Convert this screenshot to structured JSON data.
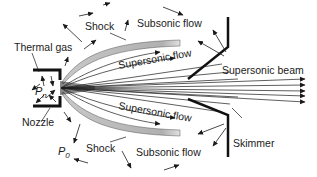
{
  "diagram": {
    "labels": {
      "thermal_gas": "Thermal gas",
      "shock_top": "Shock",
      "subsonic_top": "Subsonic flow",
      "supersonic_top": "Supersonic flow",
      "supersonic_beam": "Supersonic beam",
      "nozzle": "Nozzle",
      "pressure_nozzle": "P",
      "pressure_nozzle_sub": "n",
      "pressure_bg": "P",
      "pressure_bg_sub": "0",
      "supersonic_bottom": "Supersonic flow",
      "shock_bottom": "Shock",
      "subsonic_bottom": "Subsonic flow",
      "skimmer": "Skimmer"
    },
    "colors": {
      "ink": "#1a1a1a",
      "shock_fill": "#b8b8b8",
      "background": "#ffffff"
    }
  }
}
